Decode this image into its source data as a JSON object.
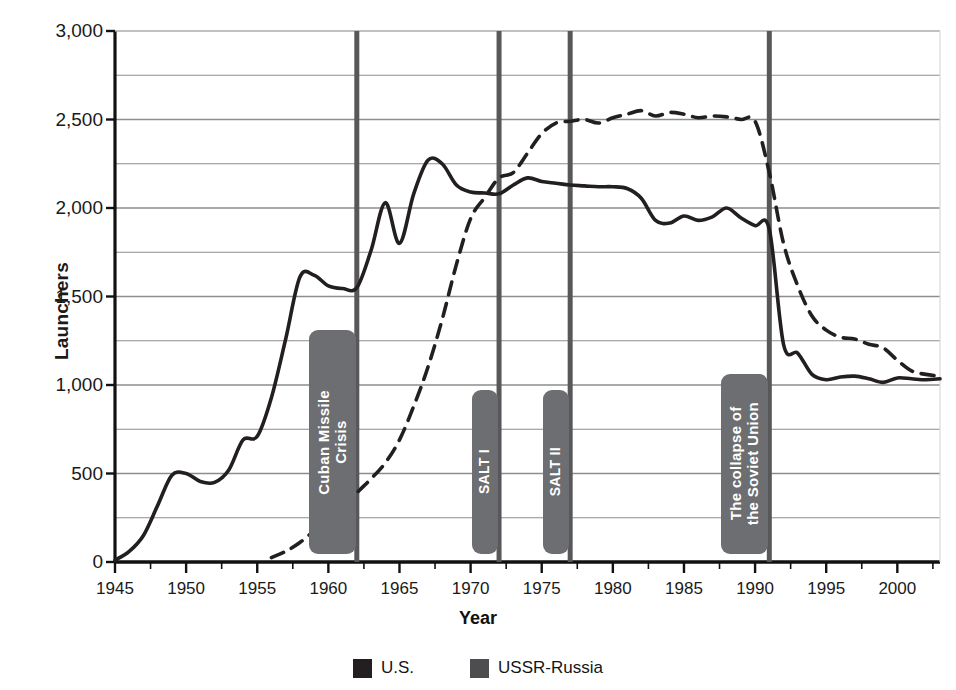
{
  "figure": {
    "background": "#ffffff",
    "axis_color": "#111111",
    "grid_color": "#8d8d8d",
    "event_line_color": "#58585a",
    "event_box_color": "#6d6e71",
    "us_color": "#231f20",
    "ussr_color": "#4d4d4f"
  },
  "axes": {
    "ylabel": "Launchers",
    "xlabel": "Year",
    "ytick_labels": [
      "0",
      "500",
      "1,000",
      "1,500",
      "2,000",
      "2,500",
      "3,000"
    ],
    "ytick_values": [
      0,
      500,
      1000,
      1500,
      2000,
      2500,
      3000
    ],
    "gridline_values": [
      250,
      500,
      750,
      1000,
      1250,
      1500,
      1750,
      2000,
      2250,
      2500,
      2750,
      3000
    ],
    "xtick_labels": [
      "1945",
      "1950",
      "1955",
      "1960",
      "1965",
      "1970",
      "1975",
      "1980",
      "1985",
      "1990",
      "1995",
      "2000"
    ],
    "xtick_values": [
      1945,
      1950,
      1955,
      1960,
      1965,
      1970,
      1975,
      1980,
      1985,
      1990,
      1995,
      2000
    ]
  },
  "legend": {
    "items": [
      {
        "label": "U.S.",
        "color": "#231f20",
        "swatch_name": "legend-swatch-us"
      },
      {
        "label": "USSR-Russia",
        "color": "#4d4d4f",
        "swatch_name": "legend-swatch-ussr"
      }
    ]
  },
  "events": [
    {
      "label": "Cuban Missile\nCrisis",
      "year": 1962,
      "box_top": 330,
      "box_height": 224,
      "box_width": 47,
      "box_side": "left"
    },
    {
      "label": "SALT I",
      "year": 1972,
      "box_top": 390,
      "box_height": 164,
      "box_width": 26,
      "box_side": "left"
    },
    {
      "label": "SALT II",
      "year": 1977,
      "box_top": 390,
      "box_height": 164,
      "box_width": 26,
      "box_side": "left"
    },
    {
      "label": "The collapse of\nthe Soviet Union",
      "year": 1991,
      "box_top": 374,
      "box_height": 180,
      "box_width": 47,
      "box_side": "left"
    }
  ],
  "chart_data": {
    "type": "line",
    "title": "",
    "xlabel": "Year",
    "ylabel": "Launchers",
    "xlim": [
      1945,
      2003
    ],
    "ylim": [
      0,
      3000
    ],
    "grid": true,
    "legend_position": "bottom-center",
    "annotations": [
      {
        "text": "Cuban Missile Crisis",
        "x": 1962
      },
      {
        "text": "SALT I",
        "x": 1972
      },
      {
        "text": "SALT II",
        "x": 1977
      },
      {
        "text": "The collapse of the Soviet Union",
        "x": 1991
      }
    ],
    "series": [
      {
        "name": "U.S.",
        "style": "solid",
        "color": "#231f20",
        "x": [
          1945,
          1946,
          1947,
          1948,
          1949,
          1950,
          1951,
          1952,
          1953,
          1954,
          1955,
          1956,
          1957,
          1958,
          1959,
          1960,
          1961,
          1962,
          1963,
          1964,
          1965,
          1966,
          1967,
          1968,
          1969,
          1970,
          1971,
          1972,
          1973,
          1974,
          1975,
          1976,
          1977,
          1978,
          1979,
          1980,
          1981,
          1982,
          1983,
          1984,
          1985,
          1986,
          1987,
          1988,
          1989,
          1990,
          1991,
          1992,
          1993,
          1994,
          1995,
          1996,
          1997,
          1998,
          1999,
          2000,
          2001,
          2002,
          2003
        ],
        "y": [
          10,
          60,
          150,
          320,
          490,
          500,
          455,
          450,
          520,
          690,
          710,
          930,
          1260,
          1610,
          1620,
          1560,
          1545,
          1550,
          1760,
          2030,
          1800,
          2080,
          2270,
          2250,
          2130,
          2090,
          2085,
          2080,
          2130,
          2170,
          2150,
          2140,
          2130,
          2125,
          2120,
          2120,
          2110,
          2055,
          1930,
          1915,
          1955,
          1930,
          1950,
          2000,
          1945,
          1900,
          1880,
          1230,
          1180,
          1060,
          1030,
          1045,
          1050,
          1035,
          1015,
          1040,
          1035,
          1030,
          1035
        ]
      },
      {
        "name": "USSR-Russia",
        "style": "dashed",
        "color": "#231f20",
        "x": [
          1956,
          1957,
          1958,
          1959,
          1960,
          1961,
          1962,
          1963,
          1964,
          1965,
          1966,
          1967,
          1968,
          1969,
          1970,
          1971,
          1972,
          1973,
          1974,
          1975,
          1976,
          1977,
          1978,
          1979,
          1980,
          1981,
          1982,
          1983,
          1984,
          1985,
          1986,
          1987,
          1988,
          1989,
          1990,
          1991,
          1992,
          1993,
          1994,
          1995,
          1996,
          1997,
          1998,
          1999,
          2000,
          2001,
          2002,
          2003
        ],
        "y": [
          25,
          60,
          110,
          175,
          230,
          300,
          390,
          470,
          560,
          690,
          880,
          1100,
          1370,
          1680,
          1940,
          2060,
          2170,
          2200,
          2310,
          2420,
          2480,
          2490,
          2500,
          2480,
          2510,
          2530,
          2550,
          2520,
          2540,
          2530,
          2510,
          2520,
          2515,
          2500,
          2490,
          2200,
          1800,
          1560,
          1390,
          1310,
          1270,
          1260,
          1230,
          1210,
          1140,
          1080,
          1060,
          1050
        ]
      }
    ]
  }
}
